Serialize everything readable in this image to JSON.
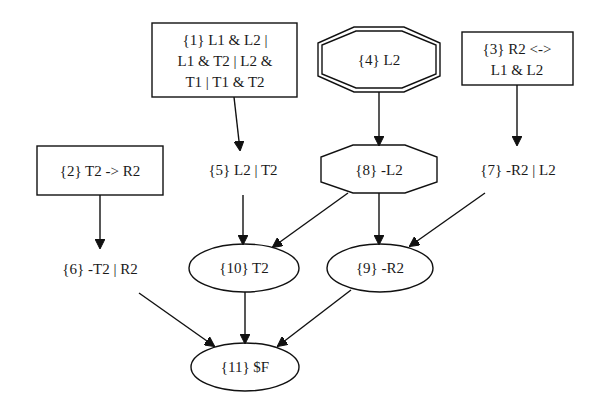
{
  "diagram": {
    "type": "directed-graph",
    "nodes": [
      {
        "id": "1",
        "shape": "box",
        "lines": [
          "{1} L1 & L2 |",
          "L1 & T2 | L2 &",
          "T1 | T1 & T2"
        ]
      },
      {
        "id": "2",
        "shape": "box",
        "lines": [
          "{2} T2 -> R2"
        ]
      },
      {
        "id": "3",
        "shape": "box",
        "lines": [
          "{3} R2 <->",
          "L1 & L2"
        ]
      },
      {
        "id": "4",
        "shape": "doubleoctagon",
        "lines": [
          "{4} L2"
        ]
      },
      {
        "id": "5",
        "shape": "plaintext",
        "lines": [
          "{5} L2 | T2"
        ]
      },
      {
        "id": "6",
        "shape": "plaintext",
        "lines": [
          "{6} -T2 | R2"
        ]
      },
      {
        "id": "7",
        "shape": "plaintext",
        "lines": [
          "{7} -R2 | L2"
        ]
      },
      {
        "id": "8",
        "shape": "octagon",
        "lines": [
          "{8} -L2"
        ]
      },
      {
        "id": "9",
        "shape": "ellipse",
        "lines": [
          "{9} -R2"
        ]
      },
      {
        "id": "10",
        "shape": "ellipse",
        "lines": [
          "{10} T2"
        ]
      },
      {
        "id": "11",
        "shape": "ellipse",
        "lines": [
          "{11} $F"
        ]
      }
    ],
    "edges": [
      {
        "from": "1",
        "to": "5"
      },
      {
        "from": "2",
        "to": "6"
      },
      {
        "from": "3",
        "to": "7"
      },
      {
        "from": "4",
        "to": "8"
      },
      {
        "from": "5",
        "to": "10"
      },
      {
        "from": "8",
        "to": "10"
      },
      {
        "from": "8",
        "to": "9"
      },
      {
        "from": "7",
        "to": "9"
      },
      {
        "from": "6",
        "to": "11"
      },
      {
        "from": "10",
        "to": "11"
      },
      {
        "from": "9",
        "to": "11"
      }
    ]
  }
}
